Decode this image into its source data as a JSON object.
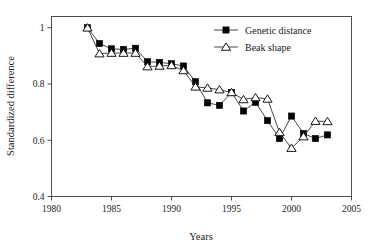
{
  "chart_data": {
    "type": "line",
    "title": "",
    "xlabel": "Years",
    "ylabel": "Standardized difference",
    "xlim": [
      1980,
      2005
    ],
    "ylim": [
      0.4,
      1.04
    ],
    "xticks": [
      1980,
      1985,
      1990,
      1995,
      2000,
      2005
    ],
    "xtick_labels": [
      "1980",
      "1985",
      "1990",
      "1995",
      "2000",
      "2005"
    ],
    "yticks": [
      0.4,
      0.6,
      0.8,
      1.0
    ],
    "ytick_labels": [
      "0.4",
      "0.6",
      "0.8",
      "1"
    ],
    "grid": false,
    "legend_position": "top-right",
    "series": [
      {
        "name": "Genetic distance",
        "marker": "filled-square",
        "x": [
          1983,
          1984,
          1985,
          1986,
          1987,
          1988,
          1989,
          1990,
          1991,
          1992,
          1993,
          1994,
          1995,
          1996,
          1997,
          1998,
          1999,
          2000,
          2001,
          2002,
          2003
        ],
        "values": [
          1.0,
          0.944,
          0.925,
          0.923,
          0.927,
          0.879,
          0.877,
          0.872,
          0.864,
          0.808,
          0.733,
          0.724,
          0.77,
          0.704,
          0.735,
          0.67,
          0.606,
          0.686,
          0.624,
          0.606,
          0.619
        ]
      },
      {
        "name": "Beak shape",
        "marker": "open-triangle",
        "x": [
          1983,
          1984,
          1985,
          1986,
          1987,
          1988,
          1989,
          1990,
          1991,
          1992,
          1993,
          1994,
          1995,
          1996,
          1997,
          1998,
          1999,
          2000,
          2001,
          2002,
          2003
        ],
        "values": [
          1.0,
          0.908,
          0.91,
          0.91,
          0.91,
          0.862,
          0.864,
          0.866,
          0.848,
          0.79,
          0.786,
          0.78,
          0.77,
          0.745,
          0.752,
          0.747,
          0.628,
          0.572,
          0.613,
          0.668,
          0.667
        ]
      }
    ]
  },
  "legend": {
    "entries": [
      {
        "label": "Genetic distance",
        "marker": "filled-square"
      },
      {
        "label": "Beak shape",
        "marker": "open-triangle"
      }
    ]
  },
  "axes": {
    "x_title": "Years",
    "y_title": "Standardized difference"
  }
}
